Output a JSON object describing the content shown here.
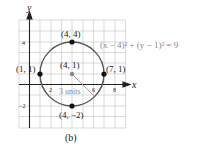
{
  "figure": {
    "caption": "(b)",
    "equation": "(x − 4)² + (y − 1)² = 9",
    "axes": {
      "x_label": "x",
      "y_label": "y",
      "x_ticks": [
        "2",
        "6",
        "8"
      ],
      "y_ticks": [
        "4",
        "−2"
      ]
    },
    "center": {
      "label": "(4, 1)",
      "x": 4,
      "y": 1
    },
    "radius": {
      "value": 3,
      "label": "3 units"
    },
    "points": [
      {
        "label": "(4, 4)",
        "x": 4,
        "y": 4
      },
      {
        "label": "(1, 1)",
        "x": 1,
        "y": 1
      },
      {
        "label": "(7, 1)",
        "x": 7,
        "y": 1
      },
      {
        "label": "(4, −2)",
        "x": 4,
        "y": -2
      }
    ],
    "colors": {
      "grid": "#c8c8c8",
      "circle": "#555555",
      "axis": "#222222",
      "radius_line": "#999999",
      "point": "#111111",
      "center_point": "#888888"
    }
  }
}
